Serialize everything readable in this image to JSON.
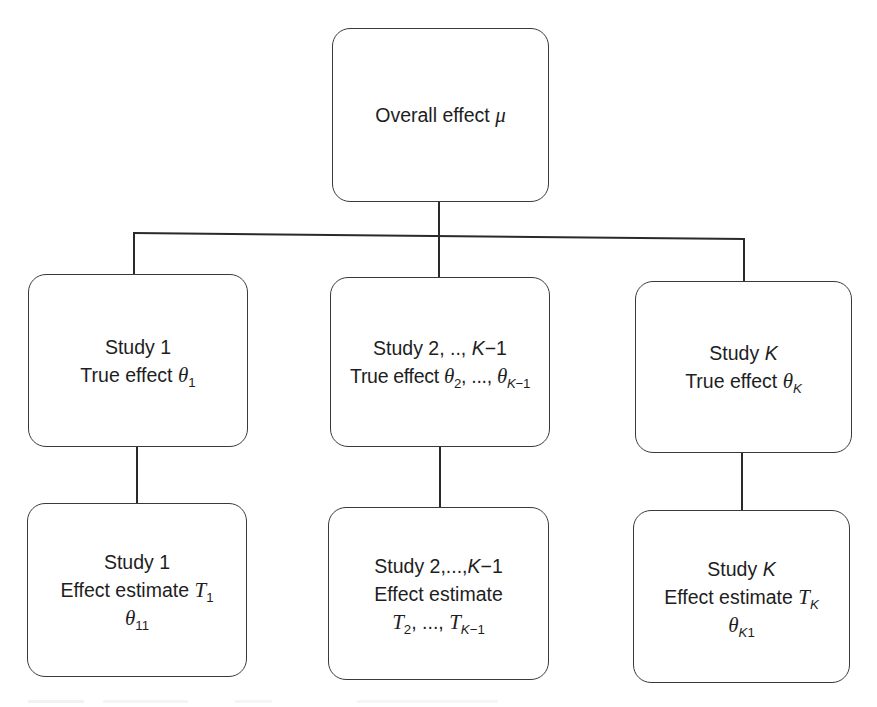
{
  "diagram": {
    "root": {
      "label": "Overall effect ",
      "symbol": "μ"
    },
    "level1": [
      {
        "title": "Study 1",
        "line2_label": "True effect ",
        "symbol": "θ",
        "sub": "1"
      },
      {
        "title_prefix": "Study 2, .., ",
        "title_var": "K",
        "title_suffix": "−1",
        "line2_label": "True effect ",
        "symbol": "θ",
        "sub_a": "2",
        "sep": ", ..., ",
        "symbol_b": "θ",
        "sub_b_var": "K",
        "sub_b_suffix": "−1"
      },
      {
        "title_prefix": "Study ",
        "title_var": "K",
        "line2_label": "True effect ",
        "symbol": "θ",
        "sub_var": "K"
      }
    ],
    "level2": [
      {
        "title": "Study 1",
        "line2_label": "Effect estimate ",
        "symbol": "T",
        "sub": "1",
        "line3_symbol": "θ",
        "line3_sub": "11"
      },
      {
        "title_prefix": "Study 2,...,",
        "title_var": "K",
        "title_suffix": "−1",
        "line2_label": "Effect estimate",
        "symbol": "T",
        "sub_a": "2",
        "sep": ", ..., ",
        "symbol_b": "T",
        "sub_b_var": "K",
        "sub_b_suffix": "−1"
      },
      {
        "title_prefix": "Study ",
        "title_var": "K",
        "line2_label": "Effect estimate ",
        "symbol": "T",
        "sub_var": "K",
        "line3_symbol": "θ",
        "line3_sub_var": "K",
        "line3_sub": "1"
      }
    ]
  },
  "colors": {
    "stroke": "#2a2a2a",
    "box_border": "#3a3a3a",
    "background": "#ffffff",
    "text": "#1e1e1e"
  }
}
